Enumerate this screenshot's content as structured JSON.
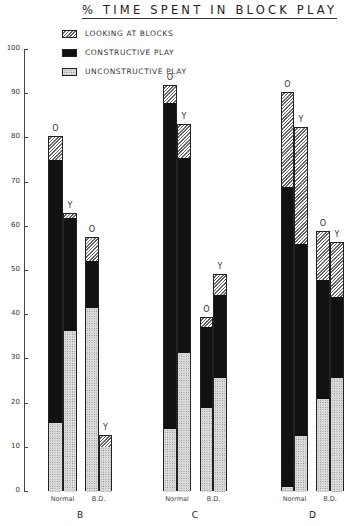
{
  "chart_data": {
    "type": "bar",
    "stacked": true,
    "title": "% TIME SPENT IN BLOCK PLAY",
    "xlabel": "",
    "ylabel": "",
    "ylim": [
      0,
      100
    ],
    "yticks": [
      0,
      10,
      20,
      30,
      40,
      50,
      60,
      70,
      80,
      90,
      100
    ],
    "grid": false,
    "legend_position": "top-left",
    "legend": [
      {
        "name": "LOOKING AT BLOCKS",
        "pattern": "hatched"
      },
      {
        "name": "CONSTRUCTIVE PLAY",
        "pattern": "solid-black"
      },
      {
        "name": "UNCONSTRUCTIVE PLAY",
        "pattern": "dotted"
      }
    ],
    "groups": [
      {
        "label": "B",
        "subgroups": [
          {
            "label": "Normal",
            "bars": [
              {
                "mark": "O",
                "unconstructive": 15.6,
                "constructive": 59.4,
                "looking": 5.4,
                "total": 80.4
              },
              {
                "mark": "Y",
                "unconstructive": 36.5,
                "constructive": 25.5,
                "looking": 1.0,
                "total": 63.0
              }
            ]
          },
          {
            "label": "B.D.",
            "bars": [
              {
                "mark": "O",
                "unconstructive": 41.6,
                "constructive": 10.7,
                "looking": 5.2,
                "total": 57.5
              },
              {
                "mark": "Y",
                "unconstructive": 10.2,
                "constructive": 0,
                "looking": 2.5,
                "total": 12.7
              }
            ]
          }
        ]
      },
      {
        "label": "C",
        "subgroups": [
          {
            "label": "Normal",
            "bars": [
              {
                "mark": "O",
                "unconstructive": 14.3,
                "constructive": 73.7,
                "looking": 3.8,
                "total": 91.8
              },
              {
                "mark": "Y",
                "unconstructive": 31.4,
                "constructive": 44.2,
                "looking": 7.4,
                "total": 83.0
              }
            ]
          },
          {
            "label": "B.D.",
            "bars": [
              {
                "mark": "O",
                "unconstructive": 19.0,
                "constructive": 18.3,
                "looking": 2.1,
                "total": 39.4
              },
              {
                "mark": "Y",
                "unconstructive": 25.8,
                "constructive": 18.8,
                "looking": 4.5,
                "total": 49.1
              }
            ]
          }
        ]
      },
      {
        "label": "D",
        "subgroups": [
          {
            "label": "Normal",
            "bars": [
              {
                "mark": "O",
                "unconstructive": 1.2,
                "constructive": 67.8,
                "looking": 21.3,
                "total": 90.3
              },
              {
                "mark": "Y",
                "unconstructive": 12.7,
                "constructive": 43.3,
                "looking": 26.4,
                "total": 82.4
              }
            ]
          },
          {
            "label": "B.D.",
            "bars": [
              {
                "mark": "O",
                "unconstructive": 21.0,
                "constructive": 27.0,
                "looking": 10.8,
                "total": 58.8
              },
              {
                "mark": "Y",
                "unconstructive": 25.8,
                "constructive": 18.3,
                "looking": 12.2,
                "total": 56.3
              }
            ]
          }
        ]
      }
    ]
  },
  "layout": {
    "y0_px": 491,
    "px_per_unit": 4.42,
    "bar_x": [
      [
        [
          48,
          63
        ],
        [
          85,
          99
        ]
      ],
      [
        [
          163,
          177
        ],
        [
          200,
          213
        ]
      ],
      [
        [
          281,
          294
        ],
        [
          316,
          330
        ]
      ]
    ],
    "bar_w": [
      [
        [
          15,
          14
        ],
        [
          14,
          13
        ]
      ],
      [
        [
          14,
          14
        ],
        [
          13,
          14
        ]
      ],
      [
        [
          13,
          14
        ],
        [
          14,
          14
        ]
      ]
    ]
  }
}
